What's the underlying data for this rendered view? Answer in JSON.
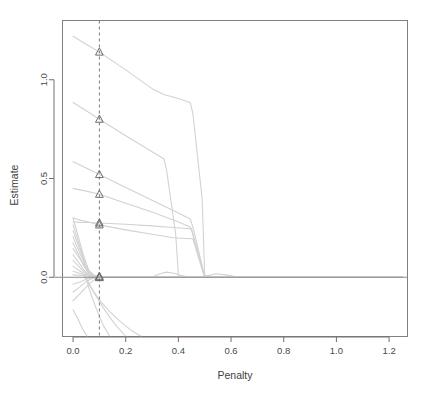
{
  "chart_data": {
    "type": "line",
    "title": "",
    "subtitle": "",
    "xlabel": "Penalty",
    "ylabel": "Estimate",
    "xlim": [
      -0.04,
      1.27
    ],
    "ylim": [
      -0.3,
      1.3
    ],
    "xticks": [
      0.0,
      0.2,
      0.4,
      0.6,
      0.8,
      1.0,
      1.2
    ],
    "xtick_labels": [
      "0.0",
      "0.2",
      "0.4",
      "0.6",
      "0.8",
      "1.0",
      "1.2"
    ],
    "yticks": [
      0.0,
      0.5,
      1.0
    ],
    "ytick_labels": [
      "0.0",
      "0.5",
      "1.0"
    ],
    "grid": false,
    "legend": null,
    "legend_position": "none",
    "zero_reference_line": {
      "orientation": "horizontal",
      "value": 0.0,
      "style": "solid",
      "color": "#8a8a8a"
    },
    "annotations": [
      {
        "type": "vertical-dashed-line",
        "label": "selected penalty",
        "x": 0.1,
        "style": "dashed",
        "color": "#7a7a7a"
      }
    ],
    "marker": {
      "shape": "triangle",
      "at_x": 0.1,
      "color": "#6e6e6e",
      "values_at_x": [
        1.14,
        0.8,
        0.52,
        0.42,
        0.275,
        0.265,
        0.005,
        0.0,
        -0.002
      ]
    },
    "series_color": "#d2d2d2",
    "series": [
      {
        "name": "term-1",
        "x": [
          0.0,
          0.05,
          0.1,
          0.2,
          0.3,
          0.345,
          0.4,
          0.445,
          0.455,
          0.49,
          0.5,
          0.55,
          0.62,
          0.8,
          1.0,
          1.25
        ],
        "y": [
          1.22,
          1.18,
          1.14,
          1.05,
          0.955,
          0.925,
          0.905,
          0.885,
          0.83,
          0.4,
          0.01,
          0.0,
          0.0,
          0.0,
          0.0,
          0.0
        ]
      },
      {
        "name": "term-2",
        "x": [
          0.0,
          0.05,
          0.1,
          0.2,
          0.3,
          0.345,
          0.355,
          0.39,
          0.4,
          0.45,
          0.6,
          0.8,
          1.0,
          1.25
        ],
        "y": [
          0.885,
          0.843,
          0.8,
          0.716,
          0.635,
          0.6,
          0.545,
          0.215,
          0.01,
          0.0,
          0.0,
          0.0,
          0.0,
          0.0
        ]
      },
      {
        "name": "term-3",
        "x": [
          0.0,
          0.05,
          0.1,
          0.2,
          0.3,
          0.4,
          0.445,
          0.455,
          0.49,
          0.5,
          0.6,
          0.8,
          1.0,
          1.25
        ],
        "y": [
          0.585,
          0.553,
          0.52,
          0.455,
          0.39,
          0.325,
          0.295,
          0.255,
          0.06,
          0.0,
          0.0,
          0.0,
          0.0,
          0.0
        ]
      },
      {
        "name": "term-4",
        "x": [
          0.0,
          0.05,
          0.1,
          0.2,
          0.3,
          0.4,
          0.445,
          0.455,
          0.49,
          0.5,
          0.6,
          0.8,
          1.0,
          1.25
        ],
        "y": [
          0.45,
          0.436,
          0.42,
          0.375,
          0.33,
          0.28,
          0.255,
          0.22,
          0.05,
          0.0,
          0.0,
          0.0,
          0.0,
          0.0
        ]
      },
      {
        "name": "term-5",
        "x": [
          0.0,
          0.03,
          0.06,
          0.1,
          0.2,
          0.3,
          0.38,
          0.42,
          0.45,
          0.455,
          0.49,
          0.5,
          0.6,
          0.8,
          1.0,
          1.25
        ],
        "y": [
          0.28,
          0.278,
          0.277,
          0.275,
          0.268,
          0.26,
          0.252,
          0.248,
          0.245,
          0.215,
          0.05,
          0.0,
          0.0,
          0.0,
          0.0,
          0.0
        ]
      },
      {
        "name": "term-6",
        "x": [
          0.0,
          0.03,
          0.06,
          0.1,
          0.2,
          0.3,
          0.38,
          0.43,
          0.45,
          0.455,
          0.49,
          0.5,
          0.6,
          0.8,
          1.0,
          1.25
        ],
        "y": [
          0.3,
          0.288,
          0.28,
          0.265,
          0.24,
          0.218,
          0.2,
          0.196,
          0.195,
          0.195,
          0.04,
          0.0,
          0.0,
          0.0,
          0.0,
          0.0
        ]
      },
      {
        "name": "term-7",
        "x": [
          0.0,
          0.02,
          0.04,
          0.06,
          0.08,
          0.1,
          0.3,
          0.6,
          1.0,
          1.25
        ],
        "y": [
          0.3,
          0.205,
          0.11,
          0.035,
          0.01,
          0.003,
          0.0,
          0.0,
          0.0,
          0.0
        ]
      },
      {
        "name": "term-8",
        "x": [
          0.0,
          0.02,
          0.04,
          0.055,
          0.07,
          0.1,
          0.3,
          0.6,
          1.0,
          1.25
        ],
        "y": [
          0.265,
          0.18,
          0.095,
          0.03,
          0.008,
          0.002,
          0.0,
          0.0,
          0.0,
          0.0
        ]
      },
      {
        "name": "term-9",
        "x": [
          0.0,
          0.02,
          0.04,
          0.06,
          0.08,
          0.1,
          0.3,
          0.6,
          1.0,
          1.25
        ],
        "y": [
          0.235,
          0.162,
          0.088,
          0.028,
          0.006,
          0.001,
          0.0,
          0.0,
          0.0,
          0.0
        ]
      },
      {
        "name": "term-10",
        "x": [
          0.0,
          0.02,
          0.045,
          0.06,
          0.08,
          0.1,
          0.3,
          0.6,
          1.0,
          1.25
        ],
        "y": [
          0.205,
          0.14,
          0.06,
          0.022,
          0.005,
          0.001,
          0.0,
          0.0,
          0.0,
          0.0
        ]
      },
      {
        "name": "term-11",
        "x": [
          0.0,
          0.02,
          0.04,
          0.06,
          0.08,
          0.1,
          0.3,
          0.6,
          1.0,
          1.25
        ],
        "y": [
          0.175,
          0.118,
          0.058,
          0.018,
          0.004,
          0.001,
          0.0,
          0.0,
          0.0,
          0.0
        ]
      },
      {
        "name": "term-12",
        "x": [
          0.0,
          0.025,
          0.05,
          0.07,
          0.09,
          0.1,
          0.3,
          0.6,
          1.0,
          1.25
        ],
        "y": [
          0.145,
          0.095,
          0.045,
          0.012,
          0.002,
          0.001,
          0.0,
          0.0,
          0.0,
          0.0
        ]
      },
      {
        "name": "term-13",
        "x": [
          0.0,
          0.02,
          0.04,
          0.06,
          0.08,
          0.1,
          0.3,
          0.6,
          1.0,
          1.25
        ],
        "y": [
          0.115,
          0.078,
          0.038,
          0.01,
          0.002,
          0.0,
          0.0,
          0.0,
          0.0,
          0.0
        ]
      },
      {
        "name": "term-14",
        "x": [
          0.0,
          0.02,
          0.04,
          0.06,
          0.08,
          0.1,
          0.3,
          0.6,
          1.0,
          1.25
        ],
        "y": [
          0.085,
          0.058,
          0.028,
          0.008,
          0.001,
          0.0,
          0.0,
          0.0,
          0.0,
          0.0
        ]
      },
      {
        "name": "term-15",
        "x": [
          0.0,
          0.02,
          0.04,
          0.06,
          0.08,
          0.1,
          0.3,
          0.6,
          1.0,
          1.25
        ],
        "y": [
          0.055,
          0.038,
          0.018,
          0.005,
          0.001,
          0.0,
          0.0,
          0.0,
          0.0,
          0.0
        ]
      },
      {
        "name": "term-16",
        "x": [
          0.0,
          0.03,
          0.06,
          0.08,
          0.1,
          0.3,
          0.6,
          1.0,
          1.25
        ],
        "y": [
          0.03,
          0.018,
          0.006,
          0.001,
          0.0,
          0.0,
          0.0,
          0.0,
          0.0
        ]
      },
      {
        "name": "term-17",
        "x": [
          0.0,
          0.03,
          0.055,
          0.08,
          0.1,
          0.3,
          0.6,
          1.0,
          1.25
        ],
        "y": [
          -0.035,
          -0.022,
          -0.008,
          -0.002,
          0.0,
          0.0,
          0.0,
          0.0,
          0.0
        ]
      },
      {
        "name": "term-18",
        "x": [
          0.0,
          0.025,
          0.05,
          0.075,
          0.1,
          0.3,
          0.6,
          1.0,
          1.25
        ],
        "y": [
          -0.075,
          -0.05,
          -0.022,
          -0.005,
          0.0,
          0.0,
          0.0,
          0.0,
          0.0
        ]
      },
      {
        "name": "term-19",
        "x": [
          0.0,
          0.03,
          0.06,
          0.085,
          0.1,
          0.3,
          0.6,
          1.0,
          1.25
        ],
        "y": [
          -0.12,
          -0.078,
          -0.035,
          -0.008,
          0.0,
          0.0,
          0.0,
          0.0,
          0.0
        ]
      },
      {
        "name": "term-20",
        "x": [
          0.045,
          0.07,
          0.1,
          0.14,
          0.18,
          0.22,
          0.26
        ],
        "y": [
          0.005,
          -0.055,
          -0.115,
          -0.175,
          -0.225,
          -0.268,
          -0.3
        ]
      },
      {
        "name": "term-21",
        "x": [
          0.045,
          0.08,
          0.12,
          0.16,
          0.2
        ],
        "y": [
          0.003,
          -0.08,
          -0.165,
          -0.24,
          -0.3
        ]
      },
      {
        "name": "term-22",
        "x": [
          0.048,
          0.065,
          0.09,
          0.115,
          0.14
        ],
        "y": [
          0.002,
          -0.075,
          -0.165,
          -0.245,
          -0.3
        ]
      },
      {
        "name": "term-23",
        "x": [
          0.0,
          0.02,
          0.035,
          0.05,
          0.055
        ],
        "y": [
          -0.165,
          -0.215,
          -0.258,
          -0.292,
          -0.3
        ]
      },
      {
        "name": "term-24",
        "x": [
          0.3,
          0.33,
          0.355,
          0.385,
          0.42,
          0.46,
          0.5,
          0.54,
          0.58,
          0.62,
          0.7,
          0.9,
          1.25
        ],
        "y": [
          0.0,
          0.018,
          0.026,
          0.02,
          0.004,
          0.0,
          0.004,
          0.018,
          0.012,
          0.002,
          0.0,
          0.0,
          0.0
        ]
      },
      {
        "name": "term-25",
        "x": [
          0.0,
          0.1,
          0.3,
          0.45,
          0.6,
          0.8,
          1.0,
          1.25
        ],
        "y": [
          0.012,
          0.004,
          0.0,
          0.0,
          0.0,
          0.0,
          0.0,
          0.0
        ]
      }
    ]
  },
  "plot": {
    "box_border_color": "#808080",
    "background": "#ffffff"
  }
}
